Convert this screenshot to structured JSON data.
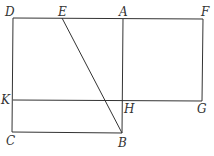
{
  "diagram": {
    "points": {
      "D": {
        "label": "D",
        "x": 13,
        "y": 18,
        "lx": 5,
        "ly": 16
      },
      "E": {
        "label": "E",
        "x": 62,
        "y": 18,
        "lx": 58,
        "ly": 16
      },
      "A": {
        "label": "A",
        "x": 123,
        "y": 19,
        "lx": 119,
        "ly": 16
      },
      "F": {
        "label": "F",
        "x": 203,
        "y": 19,
        "lx": 201,
        "ly": 16
      },
      "K": {
        "label": "K",
        "x": 13,
        "y": 100,
        "lx": 1,
        "ly": 104
      },
      "H": {
        "label": "H",
        "x": 123,
        "y": 101,
        "lx": 124,
        "ly": 113
      },
      "G": {
        "label": "G",
        "x": 202,
        "y": 101,
        "lx": 197,
        "ly": 113
      },
      "C": {
        "label": "C",
        "x": 12,
        "y": 132,
        "lx": 6,
        "ly": 145
      },
      "B": {
        "label": "B",
        "x": 122,
        "y": 133,
        "lx": 118,
        "ly": 147
      }
    },
    "segments": [
      [
        "D",
        "F"
      ],
      [
        "D",
        "C"
      ],
      [
        "C",
        "B"
      ],
      [
        "A",
        "B"
      ],
      [
        "F",
        "G"
      ],
      [
        "K",
        "G"
      ],
      [
        "E",
        "B"
      ]
    ]
  }
}
